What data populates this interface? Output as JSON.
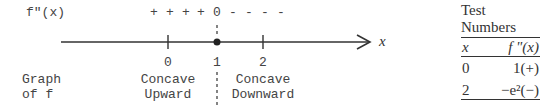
{
  "diagram": {
    "row_label_derivative": "f\"(x)",
    "sign_row": [
      "+",
      "+",
      "+",
      "+",
      "0",
      "-",
      "-",
      "-",
      "-"
    ],
    "axis_label": "x",
    "ticks": [
      {
        "value": "0",
        "type": "tick"
      },
      {
        "value": "1",
        "type": "point"
      },
      {
        "value": "2",
        "type": "tick"
      }
    ],
    "graph_label_line1": "Graph",
    "graph_label_line2": "of f",
    "regions": [
      {
        "line1": "Concave",
        "line2": "Upward"
      },
      {
        "line1": "Concave",
        "line2": "Downward"
      }
    ]
  },
  "table": {
    "title": "Test Numbers",
    "headers": [
      "x",
      "f \"(x)"
    ],
    "rows": [
      [
        "0",
        "1(+)"
      ],
      [
        "2",
        "−e²(−)"
      ]
    ]
  }
}
